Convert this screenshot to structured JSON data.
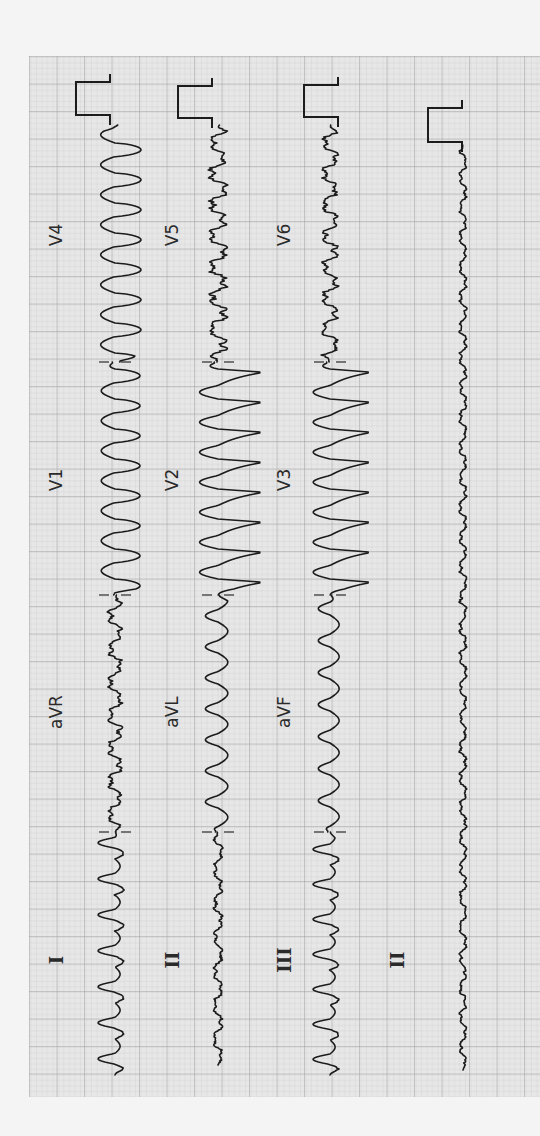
{
  "document": {
    "type": "12-lead ECG tracing (rotated 90° clockwise)",
    "orientation": "time axis runs bottom-to-top; leads stacked left-to-right"
  },
  "colors": {
    "page_bg": "#f4f4f4",
    "grid_bg": "#e6e6e6",
    "grid_minor": "#c9c9c9",
    "grid_major": "#9a9a9a",
    "trace": "#1c1c1c"
  },
  "grid": {
    "x": 29,
    "y": 56,
    "width": 511,
    "height": 1041,
    "minor": 5.5,
    "major": 27.5
  },
  "rows": [
    {
      "id": "row1",
      "baseline_x": 115,
      "segments": [
        {
          "lead": "I",
          "label_y": 960,
          "y_start": 1075,
          "y_end": 832,
          "amp": 34,
          "period": 36,
          "shape": "sharp-neg",
          "label_style": "serif"
        },
        {
          "lead": "aVR",
          "label_y": 712,
          "y_start": 832,
          "y_end": 595,
          "amp": 16,
          "period": 33,
          "shape": "small",
          "label_style": "sans"
        },
        {
          "lead": "V1",
          "label_y": 480,
          "y_start": 595,
          "y_end": 362,
          "amp": 50,
          "period": 30,
          "shape": "wide-pos",
          "label_style": "sans"
        },
        {
          "lead": "V4",
          "label_y": 235,
          "y_start": 362,
          "y_end": 125,
          "amp": 52,
          "period": 30,
          "shape": "wide-pos",
          "label_style": "sans"
        }
      ],
      "calibration": {
        "x_base": 110,
        "y_top": 82,
        "y_bottom": 115,
        "amp": 34
      }
    },
    {
      "id": "row2",
      "baseline_x": 218,
      "segments": [
        {
          "lead": "II",
          "label_y": 960,
          "y_start": 1065,
          "y_end": 832,
          "amp": 10,
          "period": 34,
          "shape": "small",
          "label_style": "serif"
        },
        {
          "lead": "aVL",
          "label_y": 712,
          "y_start": 832,
          "y_end": 595,
          "amp": 28,
          "period": 31,
          "shape": "mid-neg",
          "label_style": "sans"
        },
        {
          "lead": "V2",
          "label_y": 480,
          "y_start": 595,
          "y_end": 362,
          "amp": 92,
          "period": 30,
          "shape": "big-pos",
          "label_style": "sans"
        },
        {
          "lead": "V5",
          "label_y": 235,
          "y_start": 362,
          "y_end": 125,
          "amp": 20,
          "period": 31,
          "shape": "small",
          "label_style": "sans"
        }
      ],
      "calibration": {
        "x_base": 212,
        "y_top": 86,
        "y_bottom": 118,
        "amp": 34
      }
    },
    {
      "id": "row3",
      "baseline_x": 330,
      "segments": [
        {
          "lead": "III",
          "label_y": 960,
          "y_start": 1075,
          "y_end": 832,
          "amp": 34,
          "period": 35,
          "shape": "sharp-neg",
          "label_style": "serif"
        },
        {
          "lead": "aVF",
          "label_y": 712,
          "y_start": 832,
          "y_end": 595,
          "amp": 26,
          "period": 32,
          "shape": "mid-neg",
          "label_style": "sans"
        },
        {
          "lead": "V3",
          "label_y": 480,
          "y_start": 595,
          "y_end": 362,
          "amp": 84,
          "period": 30,
          "shape": "big-pos",
          "label_style": "sans"
        },
        {
          "lead": "V6",
          "label_y": 235,
          "y_start": 362,
          "y_end": 125,
          "amp": 18,
          "period": 31,
          "shape": "small",
          "label_style": "sans"
        }
      ],
      "calibration": {
        "x_base": 338,
        "y_top": 85,
        "y_bottom": 117,
        "amp": 34
      }
    },
    {
      "id": "row4-rhythm",
      "baseline_x": 463,
      "segments": [
        {
          "lead": "II",
          "label_y": 960,
          "y_start": 1070,
          "y_end": 145,
          "amp": 8,
          "period": 30,
          "shape": "small",
          "label_style": "serif"
        }
      ],
      "calibration": {
        "x_base": 462,
        "y_top": 108,
        "y_bottom": 142,
        "amp": 34
      }
    }
  ],
  "label_x": {
    "row1": 56,
    "row2": 172,
    "row3": 284,
    "row4-rhythm": 397
  },
  "separators": [
    {
      "x": 115,
      "y": 832
    },
    {
      "x": 115,
      "y": 595
    },
    {
      "x": 115,
      "y": 362
    },
    {
      "x": 218,
      "y": 832
    },
    {
      "x": 218,
      "y": 595
    },
    {
      "x": 218,
      "y": 362
    },
    {
      "x": 330,
      "y": 832
    },
    {
      "x": 330,
      "y": 595
    },
    {
      "x": 330,
      "y": 362
    }
  ],
  "leads_visible": [
    "I",
    "aVR",
    "V1",
    "V4",
    "II",
    "aVL",
    "V2",
    "V5",
    "III",
    "aVF",
    "V3",
    "V6",
    "II"
  ]
}
